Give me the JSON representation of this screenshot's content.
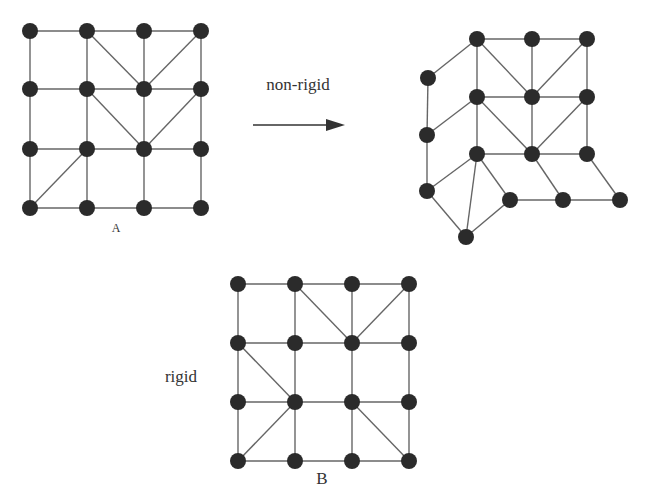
{
  "labels": {
    "arrow_label": "non-rigid",
    "rigid_label": "rigid",
    "grid_a_label": "A",
    "grid_b_label": "B"
  },
  "colors": {
    "node": "#2b2b2b",
    "edge": "#666666"
  },
  "graphs": {
    "A": {
      "nodes": [
        [
          30,
          31
        ],
        [
          87,
          31
        ],
        [
          144,
          31
        ],
        [
          201,
          31
        ],
        [
          30,
          89
        ],
        [
          87,
          89
        ],
        [
          144,
          89
        ],
        [
          201,
          89
        ],
        [
          30,
          149
        ],
        [
          87,
          149
        ],
        [
          144,
          149
        ],
        [
          201,
          149
        ],
        [
          30,
          208
        ],
        [
          87,
          208
        ],
        [
          144,
          208
        ],
        [
          201,
          208
        ]
      ],
      "edges": [
        [
          0,
          1
        ],
        [
          1,
          2
        ],
        [
          2,
          3
        ],
        [
          4,
          5
        ],
        [
          5,
          6
        ],
        [
          6,
          7
        ],
        [
          8,
          9
        ],
        [
          9,
          10
        ],
        [
          10,
          11
        ],
        [
          12,
          13
        ],
        [
          13,
          14
        ],
        [
          14,
          15
        ],
        [
          0,
          4
        ],
        [
          4,
          8
        ],
        [
          8,
          12
        ],
        [
          1,
          5
        ],
        [
          5,
          9
        ],
        [
          9,
          13
        ],
        [
          2,
          6
        ],
        [
          6,
          10
        ],
        [
          10,
          14
        ],
        [
          3,
          7
        ],
        [
          7,
          11
        ],
        [
          11,
          15
        ],
        [
          1,
          6
        ],
        [
          3,
          6
        ],
        [
          5,
          10
        ],
        [
          7,
          10
        ],
        [
          12,
          9
        ]
      ]
    },
    "nonrigid": {
      "nodes": [
        [
          477,
          39
        ],
        [
          532,
          39
        ],
        [
          587,
          39
        ],
        [
          428,
          78
        ],
        [
          477,
          97
        ],
        [
          532,
          97
        ],
        [
          587,
          97
        ],
        [
          427,
          135
        ],
        [
          477,
          154
        ],
        [
          532,
          154
        ],
        [
          587,
          154
        ],
        [
          427,
          191
        ],
        [
          510,
          200
        ],
        [
          563,
          200
        ],
        [
          620,
          200
        ],
        [
          466,
          237
        ]
      ],
      "edges": [
        [
          0,
          1
        ],
        [
          1,
          2
        ],
        [
          3,
          0
        ],
        [
          0,
          4
        ],
        [
          1,
          5
        ],
        [
          2,
          6
        ],
        [
          0,
          5
        ],
        [
          2,
          5
        ],
        [
          4,
          5
        ],
        [
          5,
          6
        ],
        [
          3,
          7
        ],
        [
          7,
          4
        ],
        [
          4,
          8
        ],
        [
          5,
          9
        ],
        [
          6,
          10
        ],
        [
          4,
          9
        ],
        [
          6,
          9
        ],
        [
          8,
          9
        ],
        [
          9,
          10
        ],
        [
          7,
          11
        ],
        [
          11,
          8
        ],
        [
          8,
          12
        ],
        [
          9,
          13
        ],
        [
          10,
          14
        ],
        [
          12,
          13
        ],
        [
          13,
          14
        ],
        [
          11,
          15
        ],
        [
          8,
          15
        ],
        [
          12,
          15
        ]
      ]
    },
    "B": {
      "nodes": [
        [
          238,
          284
        ],
        [
          295,
          284
        ],
        [
          352,
          284
        ],
        [
          409,
          284
        ],
        [
          238,
          343
        ],
        [
          295,
          343
        ],
        [
          352,
          343
        ],
        [
          409,
          343
        ],
        [
          238,
          402
        ],
        [
          295,
          402
        ],
        [
          352,
          402
        ],
        [
          409,
          402
        ],
        [
          238,
          461
        ],
        [
          295,
          461
        ],
        [
          352,
          461
        ],
        [
          409,
          461
        ]
      ],
      "edges": [
        [
          0,
          1
        ],
        [
          1,
          2
        ],
        [
          2,
          3
        ],
        [
          4,
          5
        ],
        [
          5,
          6
        ],
        [
          6,
          7
        ],
        [
          8,
          9
        ],
        [
          9,
          10
        ],
        [
          10,
          11
        ],
        [
          12,
          13
        ],
        [
          13,
          14
        ],
        [
          14,
          15
        ],
        [
          0,
          4
        ],
        [
          4,
          8
        ],
        [
          8,
          12
        ],
        [
          1,
          5
        ],
        [
          5,
          9
        ],
        [
          9,
          13
        ],
        [
          2,
          6
        ],
        [
          6,
          10
        ],
        [
          10,
          14
        ],
        [
          3,
          7
        ],
        [
          7,
          11
        ],
        [
          11,
          15
        ],
        [
          1,
          6
        ],
        [
          3,
          6
        ],
        [
          4,
          9
        ],
        [
          12,
          9
        ],
        [
          10,
          15
        ]
      ]
    }
  }
}
